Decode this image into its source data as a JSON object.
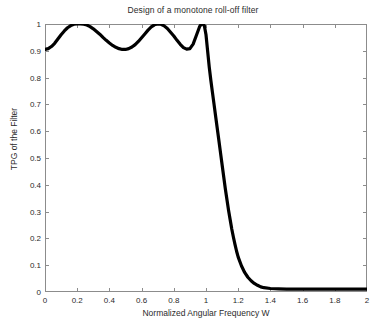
{
  "chart_data": {
    "type": "line",
    "title": "Design of a monotone roll-off filter",
    "xlabel": "Normalized Angular Frequency W",
    "ylabel": "TPG of the Filter",
    "xlim": [
      0,
      2
    ],
    "ylim": [
      0,
      1
    ],
    "grid": false,
    "legend": null,
    "line_color": "#000000",
    "line_width": 3.2,
    "xticks": [
      0,
      0.2,
      0.4,
      0.6,
      0.8,
      1,
      1.2,
      1.4,
      1.6,
      1.8,
      2
    ],
    "xtick_labels": [
      "0",
      "0.2",
      "0.4",
      "0.6",
      "0.8",
      "1",
      "1.2",
      "1.4",
      "1.6",
      "1.8",
      "2"
    ],
    "yticks": [
      0,
      0.1,
      0.2,
      0.3,
      0.4,
      0.5,
      0.6,
      0.7,
      0.8,
      0.9,
      1
    ],
    "ytick_labels": [
      "0",
      "0.1",
      "0.2",
      "0.3",
      "0.4",
      "0.5",
      "0.6",
      "0.7",
      "0.8",
      "0.9",
      "1"
    ],
    "series": [
      {
        "name": "TPG",
        "x": [
          0,
          0.02,
          0.04,
          0.06,
          0.08,
          0.1,
          0.12,
          0.14,
          0.16,
          0.18,
          0.2,
          0.22,
          0.24,
          0.26,
          0.28,
          0.3,
          0.32,
          0.34,
          0.36,
          0.38,
          0.4,
          0.42,
          0.44,
          0.46,
          0.48,
          0.5,
          0.52,
          0.54,
          0.56,
          0.58,
          0.6,
          0.62,
          0.64,
          0.66,
          0.68,
          0.7,
          0.72,
          0.74,
          0.76,
          0.78,
          0.8,
          0.82,
          0.84,
          0.86,
          0.88,
          0.9,
          0.92,
          0.94,
          0.96,
          0.97,
          0.98,
          0.99,
          1.0,
          1.01,
          1.02,
          1.03,
          1.04,
          1.05,
          1.06,
          1.07,
          1.08,
          1.09,
          1.1,
          1.11,
          1.12,
          1.13,
          1.14,
          1.15,
          1.16,
          1.17,
          1.18,
          1.19,
          1.2,
          1.22,
          1.24,
          1.26,
          1.28,
          1.3,
          1.32,
          1.34,
          1.36,
          1.4,
          1.45,
          1.5,
          1.55,
          1.6,
          1.65,
          1.7,
          1.75,
          1.8,
          1.85,
          1.9,
          1.95,
          2.0
        ],
        "y": [
          0.905,
          0.908,
          0.916,
          0.928,
          0.944,
          0.96,
          0.974,
          0.986,
          0.994,
          0.999,
          1.0,
          1.0,
          0.999,
          0.996,
          0.99,
          0.982,
          0.972,
          0.962,
          0.95,
          0.939,
          0.929,
          0.92,
          0.913,
          0.908,
          0.905,
          0.905,
          0.908,
          0.914,
          0.923,
          0.935,
          0.949,
          0.963,
          0.977,
          0.989,
          0.997,
          1.0,
          0.999,
          0.993,
          0.983,
          0.969,
          0.955,
          0.939,
          0.924,
          0.912,
          0.906,
          0.908,
          0.925,
          0.957,
          0.99,
          0.999,
          1.0,
          0.993,
          0.96,
          0.9,
          0.84,
          0.79,
          0.745,
          0.7,
          0.655,
          0.61,
          0.565,
          0.52,
          0.475,
          0.43,
          0.385,
          0.345,
          0.305,
          0.27,
          0.235,
          0.205,
          0.178,
          0.152,
          0.13,
          0.098,
          0.073,
          0.055,
          0.042,
          0.032,
          0.025,
          0.019,
          0.016,
          0.013,
          0.012,
          0.011,
          0.011,
          0.011,
          0.011,
          0.011,
          0.011,
          0.011,
          0.011,
          0.011,
          0.011,
          0.011
        ]
      }
    ],
    "annotations": {
      "passband_ripple_min": 0.905,
      "passband_ripple_max": 1.0,
      "passband_peaks_w": [
        0.21,
        0.7,
        0.98
      ],
      "passband_valleys_w": [
        0.0,
        0.49,
        0.86
      ],
      "cutoff_w": 1.0,
      "stopband_floor": 0.011
    }
  }
}
